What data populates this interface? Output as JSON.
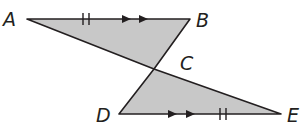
{
  "diagram": {
    "type": "geometry-figure",
    "fill_color": "#c8c8c8",
    "stroke_color": "#231f20",
    "points": {
      "A": {
        "label": "A",
        "x": 27,
        "y": 19
      },
      "B": {
        "label": "B",
        "x": 190,
        "y": 19
      },
      "C": {
        "label": "C",
        "x": 154,
        "y": 69
      },
      "D": {
        "label": "D",
        "x": 119,
        "y": 114
      },
      "E": {
        "label": "E",
        "x": 281,
        "y": 114
      }
    },
    "segments": [
      {
        "from": "A",
        "to": "B",
        "marks": "double-tick congruence, double arrow parallel"
      },
      {
        "from": "B",
        "to": "C",
        "marks": "none"
      },
      {
        "from": "A",
        "to": "E",
        "marks": "none (passes through C)"
      },
      {
        "from": "C",
        "to": "D",
        "marks": "none"
      },
      {
        "from": "D",
        "to": "E",
        "marks": "double arrow parallel, double-tick congruence"
      }
    ],
    "labels": {
      "A": "A",
      "B": "B",
      "C": "C",
      "D": "D",
      "E": "E"
    }
  }
}
